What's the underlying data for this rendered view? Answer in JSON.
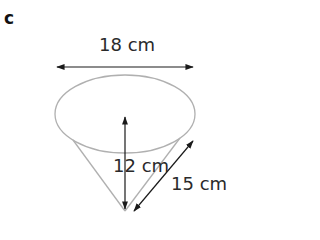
{
  "part_label": "c",
  "figure": {
    "type": "cone",
    "labels": {
      "diameter": "18 cm",
      "height": "12 cm",
      "slant_height": "15 cm"
    },
    "colors": {
      "outline": "#b0b0b0",
      "arrow": "#1a1a1a",
      "text": "#2a2a2a"
    }
  }
}
